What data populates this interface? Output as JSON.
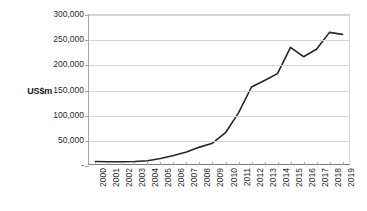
{
  "chart_data": {
    "type": "line",
    "title": "",
    "xlabel": "",
    "ylabel": "US$m",
    "categories": [
      "2000",
      "2001",
      "2002",
      "2003",
      "2004",
      "2005",
      "2006",
      "2007",
      "2008",
      "2009",
      "2010",
      "2011",
      "2012",
      "2013",
      "2014",
      "2015",
      "2016",
      "2017",
      "2018",
      "2019"
    ],
    "values": [
      5000,
      4500,
      4500,
      5000,
      6500,
      11000,
      17000,
      24000,
      34000,
      42000,
      63000,
      103000,
      155000,
      168000,
      182000,
      235000,
      216000,
      231000,
      265000,
      261000
    ],
    "series": [
      {
        "name": "US$m",
        "values": [
          5000,
          4500,
          4500,
          5000,
          6500,
          11000,
          17000,
          24000,
          34000,
          42000,
          63000,
          103000,
          155000,
          168000,
          182000,
          235000,
          216000,
          231000,
          265000,
          261000
        ]
      }
    ],
    "ylim": [
      0,
      300000
    ],
    "ytick_values": [
      0,
      50000,
      100000,
      150000,
      200000,
      250000,
      300000
    ],
    "ytick_labels": [
      "-",
      "50,000",
      "100,000",
      "150,000",
      "200,000",
      "250,000",
      "300,000"
    ],
    "grid": true,
    "grid_axis": "y",
    "legend": false,
    "legend_position": "none",
    "line_color": "#262626",
    "grid_color": "#d4d4d4",
    "axis_color": "#7a7a7a",
    "background_color": "#ffffff",
    "text_color": "#2b2b2b",
    "xtick_rotation": 90
  }
}
